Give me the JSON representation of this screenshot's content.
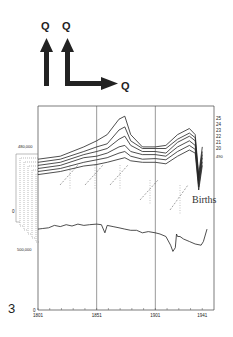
{
  "icons": {
    "arrow_labels": [
      "Q",
      "Q",
      "Q"
    ],
    "glyphs": [
      "up-arrow-icon",
      "up-right-corner-arrow-icon"
    ]
  },
  "figure_number": "3",
  "chart_data": {
    "type": "line",
    "title": "",
    "xlabel": "",
    "ylabel": "",
    "x_ticks": [
      "1801",
      "1851",
      "1901",
      "1941"
    ],
    "xlim": [
      1801,
      1951
    ],
    "y_ticks": [
      "0",
      "500,000"
    ],
    "offset_axis_labels": [
      "480,000",
      "0"
    ],
    "grid": "vertical at tick years",
    "series": [
      {
        "name": "25",
        "x": [
          1801,
          1820,
          1840,
          1851,
          1860,
          1870,
          1875,
          1880,
          1890,
          1901,
          1910,
          1920,
          1930,
          1935,
          1938,
          1941
        ],
        "values": [
          480000,
          490000,
          520000,
          540000,
          560000,
          610000,
          620000,
          560000,
          520000,
          520000,
          525000,
          560000,
          580000,
          560000,
          430000,
          520000
        ]
      },
      {
        "name": "24",
        "x": [
          1801,
          1820,
          1840,
          1851,
          1860,
          1870,
          1875,
          1880,
          1890,
          1901,
          1910,
          1920,
          1930,
          1935,
          1938,
          1941
        ],
        "values": [
          470000,
          480000,
          505000,
          520000,
          530000,
          575000,
          585000,
          540000,
          515000,
          515000,
          515000,
          545000,
          565000,
          550000,
          420000,
          505000
        ]
      },
      {
        "name": "23",
        "x": [
          1801,
          1820,
          1840,
          1851,
          1860,
          1870,
          1875,
          1880,
          1890,
          1901,
          1910,
          1920,
          1930,
          1935,
          1938,
          1941
        ],
        "values": [
          460000,
          470000,
          495000,
          505000,
          515000,
          545000,
          555000,
          525000,
          505000,
          505000,
          500000,
          535000,
          555000,
          540000,
          410000,
          495000
        ]
      },
      {
        "name": "22",
        "x": [
          1801,
          1820,
          1840,
          1851,
          1860,
          1870,
          1875,
          1880,
          1890,
          1901,
          1910,
          1920,
          1930,
          1935,
          1938,
          1941
        ],
        "values": [
          450000,
          460000,
          485000,
          490000,
          500000,
          520000,
          525000,
          505000,
          495000,
          495000,
          490000,
          520000,
          540000,
          525000,
          400000,
          485000
        ]
      },
      {
        "name": "21",
        "x": [
          1801,
          1820,
          1840,
          1851,
          1860,
          1870,
          1875,
          1880,
          1890,
          1901,
          1910,
          1920,
          1930,
          1935,
          1938,
          1941
        ],
        "values": [
          440000,
          450000,
          470000,
          478000,
          485000,
          500000,
          505000,
          490000,
          480000,
          482000,
          478000,
          505000,
          525000,
          512000,
          390000,
          472000
        ]
      },
      {
        "name": "20",
        "x": [
          1801,
          1820,
          1840,
          1851,
          1860,
          1870,
          1875,
          1880,
          1890,
          1901,
          1910,
          1920,
          1930,
          1935,
          1938,
          1941
        ],
        "values": [
          430000,
          440000,
          458000,
          463000,
          470000,
          480000,
          485000,
          475000,
          470000,
          470000,
          465000,
          490000,
          510000,
          500000,
          380000,
          460000
        ]
      },
      {
        "name": "Births",
        "x": [
          1801,
          1805,
          1810,
          1815,
          1820,
          1825,
          1830,
          1835,
          1840,
          1845,
          1851,
          1855,
          1858,
          1860,
          1865,
          1870,
          1875,
          1880,
          1885,
          1890,
          1895,
          1901,
          1905,
          1910,
          1914,
          1916,
          1918,
          1919,
          1920,
          1922,
          1925,
          1930,
          1935,
          1940,
          1942,
          1945
        ],
        "values": [
          330000,
          335000,
          340000,
          360000,
          350000,
          365000,
          355000,
          370000,
          360000,
          365000,
          370000,
          365000,
          300000,
          360000,
          350000,
          340000,
          330000,
          320000,
          320000,
          300000,
          310000,
          300000,
          290000,
          270000,
          200000,
          150000,
          180000,
          290000,
          270000,
          270000,
          250000,
          230000,
          210000,
          200000,
          230000,
          330000
        ]
      }
    ],
    "annotations": [
      "Births",
      "490"
    ]
  }
}
